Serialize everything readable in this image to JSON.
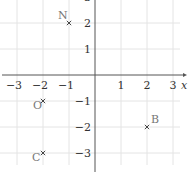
{
  "chart_data": {
    "type": "scatter",
    "title": "",
    "xlabel": "x",
    "ylabel": "",
    "xlim": [
      -3.6,
      3.7
    ],
    "ylim": [
      -3.8,
      2.9
    ],
    "grid": true,
    "x_ticks": [
      -3,
      -2,
      -1,
      1,
      2,
      3
    ],
    "y_ticks": [
      2,
      1,
      -1,
      -2,
      -3
    ],
    "x_tick_labels": [
      "−3",
      "−2",
      "−1",
      "1",
      "2",
      "3"
    ],
    "y_tick_labels": [
      "2",
      "1",
      "−1",
      "−2",
      "−3"
    ],
    "points": [
      {
        "label": "N",
        "x": -1,
        "y": 2
      },
      {
        "label": "O",
        "x": -2,
        "y": -1
      },
      {
        "label": "C",
        "x": -2,
        "y": -3
      },
      {
        "label": "B",
        "x": 2,
        "y": -2
      }
    ],
    "marker": "x",
    "colors": {
      "grid": "#e4e4e4",
      "axis": "#555555",
      "text": "#333333",
      "point_label": "#777777"
    }
  }
}
